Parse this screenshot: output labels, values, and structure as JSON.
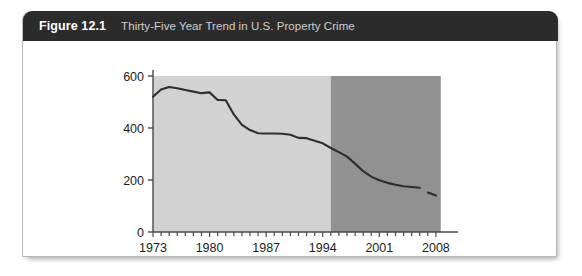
{
  "figure": {
    "label": "Figure 12.1",
    "title": "Thirty-Five Year Trend in U.S. Property Crime"
  },
  "colors": {
    "header_bg": "#2b2b2b",
    "header_label": "#ffffff",
    "header_title": "#cfcfcf",
    "card_bg": "#ffffff",
    "card_border": "#b9b9b9",
    "band_light": "#d2d2d2",
    "band_dark": "#919191",
    "line": "#2e2e2e",
    "axis": "#4a4a4a",
    "tick_text": "#1c1c1c"
  },
  "chart_data": {
    "type": "line",
    "title": "Thirty-Five Year Trend in U.S. Property Crime",
    "xlabel": "",
    "ylabel": "",
    "xlim": [
      1973,
      2009
    ],
    "ylim": [
      0,
      600
    ],
    "yticks": [
      0,
      200,
      400,
      600
    ],
    "ytick_labels": [
      "0",
      "200",
      "400",
      "600"
    ],
    "xticks": [
      1973,
      1980,
      1987,
      1994,
      2001,
      2008
    ],
    "xtick_labels": [
      "1973",
      "1980",
      "1987",
      "1994",
      "2001",
      "2008"
    ],
    "minor_xticks_every": 1,
    "grid": false,
    "legend": false,
    "shaded_bands": [
      {
        "name": "light-band",
        "x_start": 1973,
        "x_end": 1995,
        "color": "#d2d2d2"
      },
      {
        "name": "dark-band",
        "x_start": 1995,
        "x_end": 2008.6,
        "color": "#919191"
      }
    ],
    "series": [
      {
        "name": "U.S. Property Crime Rate",
        "x": [
          1973,
          1974,
          1975,
          1976,
          1977,
          1978,
          1979,
          1980,
          1981,
          1982,
          1983,
          1984,
          1985,
          1986,
          1987,
          1988,
          1989,
          1990,
          1991,
          1992,
          1993,
          1994,
          1995,
          1996,
          1997,
          1998,
          1999,
          2000,
          2001,
          2002,
          2003,
          2004,
          2005,
          2006,
          2007,
          2008
        ],
        "y": [
          520,
          548,
          558,
          553,
          546,
          540,
          534,
          537,
          508,
          507,
          452,
          412,
          392,
          380,
          379,
          379,
          378,
          374,
          362,
          361,
          351,
          341,
          323,
          307,
          290,
          263,
          234,
          213,
          199,
          189,
          182,
          176,
          173,
          170,
          152,
          140
        ],
        "line_breaks": [
          2006
        ]
      }
    ]
  }
}
